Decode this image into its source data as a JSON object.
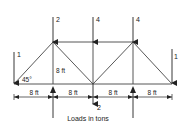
{
  "diagram": {
    "type": "truss",
    "colors": {
      "line": "#333333",
      "text": "#222222",
      "background": "#ffffff"
    },
    "top_loads": [
      {
        "node": "top-left",
        "value": "2"
      },
      {
        "node": "top-middle",
        "value": "4"
      },
      {
        "node": "top-right",
        "value": "4"
      }
    ],
    "end_loads": [
      {
        "node": "bottom-left",
        "value": "1"
      },
      {
        "node": "bottom-right",
        "value": "1"
      }
    ],
    "bottom_load": {
      "node": "bottom-middle",
      "value": "2"
    },
    "angle_label": "45°",
    "height_label": "8 ft",
    "spans": [
      "8 ft",
      "8 ft",
      "8 ft",
      "8 ft"
    ],
    "caption": "Loads in tons"
  }
}
